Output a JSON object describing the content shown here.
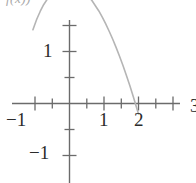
{
  "figure": {
    "title_fragment": "f(x)) ",
    "background_color": "#ffffff"
  },
  "axis_labels": {
    "x_neg1": "−1",
    "x_1": "1",
    "x_2": "2",
    "x_3_clipped": "3",
    "y_1": "1",
    "y_neg1": "−1"
  },
  "chart_data": {
    "type": "line",
    "title": "",
    "subtitle": "",
    "xlabel": "",
    "ylabel": "",
    "xlim": [
      -1.35,
      2.45
    ],
    "ylim": [
      -1.6,
      2.6
    ],
    "xticks": [
      -1,
      -0.5,
      0,
      0.5,
      1,
      1.5,
      2
    ],
    "xtick_labels": [
      "−1",
      "",
      "",
      "",
      "1",
      "",
      "2"
    ],
    "yticks": [
      -1,
      -0.5,
      0,
      0.5,
      1,
      1.5
    ],
    "ytick_labels": [
      "−1",
      "",
      "",
      "",
      "1",
      ""
    ],
    "grid": false,
    "legend": null,
    "axis_color": "#6b6b6b",
    "curve_color": "#b5b5b5",
    "curve_width": 1.6,
    "series": [
      {
        "name": "curve",
        "x": [
          -1.06,
          -0.95,
          -0.85,
          -0.75,
          -0.65,
          -0.55,
          -0.45,
          -0.35,
          -0.25,
          -0.15,
          -0.05,
          0.05,
          0.15,
          0.25,
          0.35,
          0.45,
          0.55,
          0.65,
          0.75,
          0.85,
          0.95,
          1.05,
          1.15,
          1.25,
          1.35,
          1.45,
          1.55,
          1.65,
          1.75,
          1.85,
          1.95,
          2.0
        ],
        "y": [
          1.42,
          1.62,
          1.77,
          1.9,
          2.0,
          2.09,
          2.16,
          2.21,
          2.25,
          2.27,
          2.28,
          2.28,
          2.26,
          2.23,
          2.19,
          2.13,
          2.06,
          1.98,
          1.88,
          1.78,
          1.66,
          1.53,
          1.39,
          1.24,
          1.08,
          0.91,
          0.73,
          0.54,
          0.34,
          0.13,
          -0.09,
          -0.2
        ]
      }
    ]
  },
  "geometry": {
    "origin_px": {
      "x": 69.5,
      "y": 103.5
    },
    "unit_px": {
      "x": 34.5,
      "y": 52.0
    }
  }
}
